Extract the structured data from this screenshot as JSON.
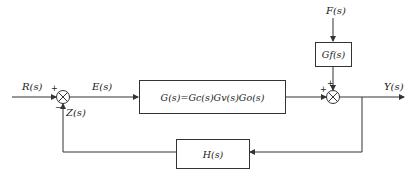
{
  "diagram": {
    "type": "control-system-block-diagram",
    "signals": {
      "input": "R(s)",
      "error": "E(s)",
      "disturbance": "F(s)",
      "output": "Y(s)",
      "feedback": "Z(s)"
    },
    "blocks": {
      "forward": "G(s)=Gc(s)Gv(s)Go(s)",
      "disturbance": "Gf(s)",
      "feedback": "H(s)"
    },
    "junctions": {
      "input_junction": {
        "signs": {
          "reference": "+",
          "feedback": "−"
        }
      },
      "output_junction": {
        "signs": {
          "forward": "+",
          "disturbance": "+"
        }
      }
    },
    "colors": {
      "line": "#333333",
      "text": "#222222",
      "background": "#ffffff"
    }
  }
}
